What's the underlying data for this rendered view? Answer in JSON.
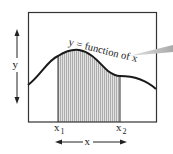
{
  "diagram": {
    "curve_label": "y = function of x",
    "y_axis_label": "y",
    "x_axis_label": "x",
    "x1_label": "x",
    "x1_sub": "1",
    "x2_label": "x",
    "x2_sub": "2",
    "colors": {
      "line": "#1a1a1a",
      "shade": "#d8d8d8",
      "hatch": "#8a8a8a",
      "pointer": "#b5b5b5",
      "background": "#ffffff"
    }
  }
}
